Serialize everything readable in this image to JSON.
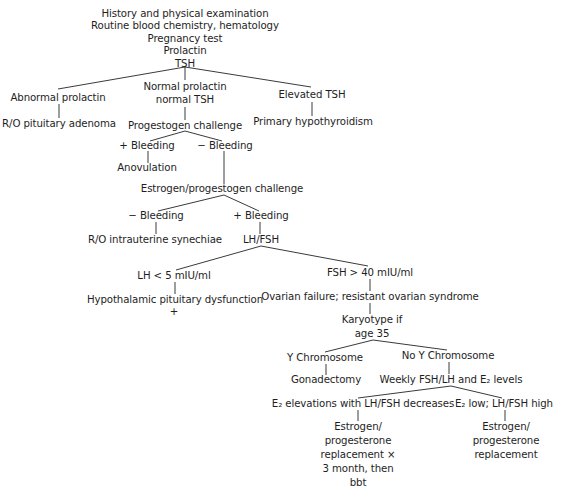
{
  "diagram": {
    "type": "flowchart",
    "root": {
      "lines": [
        "History and physical examination",
        "Routine blood chemistry, hematology",
        "Pregnancy test",
        "Prolactin",
        "TSH"
      ]
    },
    "nodes": {
      "abnormal_prolactin": "Abnormal prolactin",
      "ro_pituitary_adenoma": "R/O pituitary adenoma",
      "normal_prolactin": [
        "Normal prolactin",
        "normal TSH"
      ],
      "progestogen_challenge": "Progestogen challenge",
      "elevated_tsh": "Elevated TSH",
      "primary_hypothyroidism": "Primary hypothyroidism",
      "plus_bleeding_1": "+ Bleeding",
      "anovulation": "Anovulation",
      "minus_bleeding_1": "− Bleeding",
      "estrogen_progestogen_challenge": "Estrogen/progestogen challenge",
      "minus_bleeding_2": "− Bleeding",
      "ro_intrauterine_synechiae": "R/O intrauterine synechiae",
      "plus_bleeding_2": "+ Bleeding",
      "lh_fsh": "LH/FSH",
      "lh_low": "LH < 5 mIU/ml",
      "hypothalamic_pituitary_dysfunction": "Hypothalamic pituitary dysfunction",
      "plus_mark": "+",
      "fsh_high": "FSH > 40 mIU/ml",
      "ovarian_failure": "Ovarian failure; resistant ovarian syndrome",
      "karyotype": [
        "Karyotype if",
        "age 35"
      ],
      "y_chromosome": "Y Chromosome",
      "gonadectomy": "Gonadectomy",
      "no_y_chromosome": "No Y Chromosome",
      "weekly_levels": "Weekly FSH/LH and E₂ levels",
      "e2_elevations": "E₂ elevations with LH/FSH decreases",
      "e2_low": "E₂ low; LH/FSH high",
      "replacement_bbt": [
        "Estrogen/",
        "progesterone",
        "replacement ×",
        "3 month, then",
        "bbt"
      ],
      "replacement": [
        "Estrogen/",
        "progesterone",
        "replacement"
      ]
    },
    "edges": [
      [
        "root",
        "abnormal_prolactin"
      ],
      [
        "root",
        "normal_prolactin"
      ],
      [
        "root",
        "elevated_tsh"
      ],
      [
        "abnormal_prolactin",
        "ro_pituitary_adenoma"
      ],
      [
        "normal_prolactin",
        "progestogen_challenge"
      ],
      [
        "elevated_tsh",
        "primary_hypothyroidism"
      ],
      [
        "progestogen_challenge",
        "plus_bleeding_1"
      ],
      [
        "progestogen_challenge",
        "minus_bleeding_1"
      ],
      [
        "plus_bleeding_1",
        "anovulation"
      ],
      [
        "minus_bleeding_1",
        "estrogen_progestogen_challenge"
      ],
      [
        "estrogen_progestogen_challenge",
        "minus_bleeding_2"
      ],
      [
        "estrogen_progestogen_challenge",
        "plus_bleeding_2"
      ],
      [
        "minus_bleeding_2",
        "ro_intrauterine_synechiae"
      ],
      [
        "plus_bleeding_2",
        "lh_fsh"
      ],
      [
        "lh_fsh",
        "lh_low"
      ],
      [
        "lh_fsh",
        "fsh_high"
      ],
      [
        "lh_low",
        "hypothalamic_pituitary_dysfunction"
      ],
      [
        "fsh_high",
        "ovarian_failure"
      ],
      [
        "ovarian_failure",
        "karyotype"
      ],
      [
        "karyotype",
        "y_chromosome"
      ],
      [
        "karyotype",
        "no_y_chromosome"
      ],
      [
        "y_chromosome",
        "gonadectomy"
      ],
      [
        "no_y_chromosome",
        "weekly_levels"
      ],
      [
        "weekly_levels",
        "e2_elevations"
      ],
      [
        "weekly_levels",
        "e2_low"
      ],
      [
        "e2_elevations",
        "replacement_bbt"
      ],
      [
        "e2_low",
        "replacement"
      ]
    ],
    "colors": {
      "background": "#ffffff",
      "text": "#1e1e1e",
      "line": "#3a3a3a"
    }
  }
}
